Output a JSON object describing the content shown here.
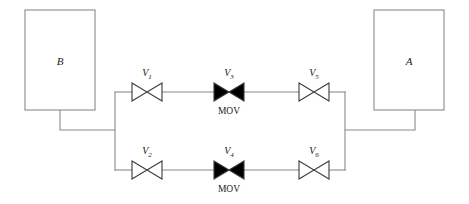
{
  "diagram": {
    "type": "piping-and-instrumentation-schematic",
    "width": 469,
    "height": 204,
    "colors": {
      "background": "#ffffff",
      "line": "#8a8a8a",
      "valve_outline": "#3a3a3a",
      "valve_fill_open": "#ffffff",
      "valve_fill_closed": "#000000",
      "text": "#1a1a1a"
    }
  },
  "vessels": [
    {
      "id": "vessel-b",
      "label": "B",
      "x": 25,
      "y": 10,
      "width": 70,
      "height": 100,
      "label_cx": 60,
      "label_cy": 61
    },
    {
      "id": "vessel-a",
      "label": "A",
      "x": 374,
      "y": 10,
      "width": 70,
      "height": 100,
      "label_cx": 409,
      "label_cy": 61
    }
  ],
  "branches": [
    {
      "id": "upper-branch",
      "y": 92,
      "valves": [
        "v1",
        "v3",
        "v5"
      ]
    },
    {
      "id": "lower-branch",
      "y": 170,
      "valves": [
        "v2",
        "v4",
        "v6"
      ]
    }
  ],
  "valves": [
    {
      "id": "v1",
      "label": "V",
      "subscript": "1",
      "type": "manual-gate-valve",
      "state": "open",
      "fill": "white",
      "cx": 147,
      "cy": 92,
      "half_width": 15,
      "half_height": 9,
      "label_cx": 147,
      "label_cy": 74,
      "mov": null
    },
    {
      "id": "v3",
      "label": "V",
      "subscript": "3",
      "type": "motor-operated-valve",
      "state": "closed",
      "fill": "black",
      "cx": 229,
      "cy": 92,
      "half_width": 15,
      "half_height": 9,
      "label_cx": 229,
      "label_cy": 74,
      "mov": "MOV",
      "mov_cx": 229,
      "mov_cy": 111
    },
    {
      "id": "v5",
      "label": "V",
      "subscript": "5",
      "type": "manual-gate-valve",
      "state": "open",
      "fill": "white",
      "cx": 314,
      "cy": 92,
      "half_width": 15,
      "half_height": 9,
      "label_cx": 314,
      "label_cy": 74,
      "mov": null
    },
    {
      "id": "v2",
      "label": "V",
      "subscript": "2",
      "type": "manual-gate-valve",
      "state": "open",
      "fill": "white",
      "cx": 147,
      "cy": 170,
      "half_width": 15,
      "half_height": 9,
      "label_cx": 147,
      "label_cy": 152,
      "mov": null
    },
    {
      "id": "v4",
      "label": "V",
      "subscript": "4",
      "type": "motor-operated-valve",
      "state": "closed",
      "fill": "black",
      "cx": 229,
      "cy": 170,
      "half_width": 15,
      "half_height": 9,
      "label_cx": 229,
      "label_cy": 152,
      "mov": "MOV",
      "mov_cx": 229,
      "mov_cy": 189
    },
    {
      "id": "v6",
      "label": "V",
      "subscript": "6",
      "type": "manual-gate-valve",
      "state": "open",
      "fill": "white",
      "cx": 314,
      "cy": 170,
      "half_width": 15,
      "half_height": 9,
      "label_cx": 314,
      "label_cy": 152,
      "mov": null
    }
  ],
  "pipes": {
    "left_header_x": 115,
    "right_header_x": 345,
    "vessel_b_drop_x": 60,
    "vessel_b_drop_y_start": 110,
    "vessel_b_run_y": 130,
    "vessel_a_riser_x": 415,
    "vessel_a_run_y": 130,
    "upper_y": 92,
    "lower_y": 170
  }
}
